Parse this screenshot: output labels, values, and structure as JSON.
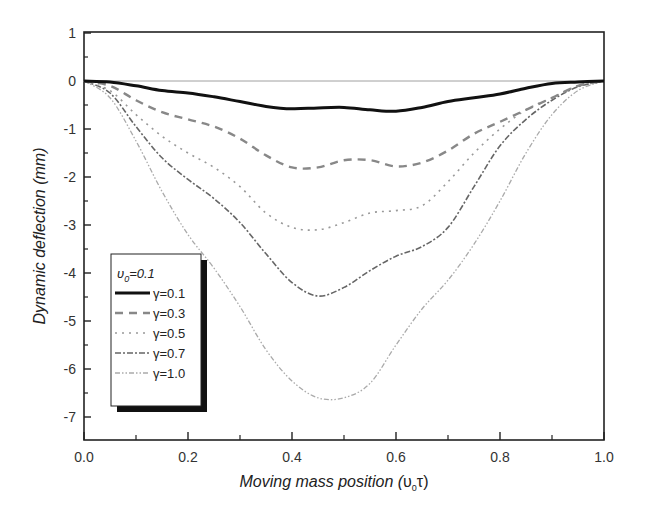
{
  "chart_data": {
    "type": "line",
    "title": "",
    "xlabel": "Moving mass position (υ0τ)",
    "xlabel_main": "Moving mass position (",
    "xlabel_sym": "υ",
    "xlabel_sub": "0",
    "xlabel_tau": "τ)",
    "ylabel": "Dynamic  deflection (mm)",
    "xlim": [
      0.0,
      1.0
    ],
    "ylim": [
      -7.5,
      1
    ],
    "xticks": [
      "0.0",
      "0.2",
      "0.4",
      "0.6",
      "0.8",
      "1.0"
    ],
    "yticks": [
      "1",
      "0",
      "-1",
      "-2",
      "-3",
      "-4",
      "-5",
      "-6",
      "-7"
    ],
    "grid": false,
    "legend_position": "lower-left inset",
    "legend_title": "υ0=0.1",
    "legend_title_sym": "υ",
    "legend_title_sub": "0",
    "legend_title_val": "=0.1",
    "x": [
      0.0,
      0.05,
      0.1,
      0.15,
      0.2,
      0.25,
      0.3,
      0.35,
      0.4,
      0.45,
      0.5,
      0.55,
      0.6,
      0.65,
      0.7,
      0.75,
      0.8,
      0.85,
      0.9,
      0.95,
      1.0
    ],
    "series": [
      {
        "name": "γ=0.1",
        "style": "solid-thick",
        "color": "#111111",
        "values": [
          0,
          -0.02,
          -0.1,
          -0.2,
          -0.25,
          -0.33,
          -0.43,
          -0.53,
          -0.58,
          -0.56,
          -0.55,
          -0.6,
          -0.63,
          -0.55,
          -0.43,
          -0.35,
          -0.27,
          -0.15,
          -0.05,
          -0.02,
          0
        ]
      },
      {
        "name": "γ=0.3",
        "style": "dashed",
        "color": "#888888",
        "values": [
          0,
          -0.1,
          -0.4,
          -0.65,
          -0.8,
          -0.95,
          -1.2,
          -1.55,
          -1.8,
          -1.8,
          -1.65,
          -1.65,
          -1.78,
          -1.7,
          -1.45,
          -1.1,
          -0.85,
          -0.6,
          -0.35,
          -0.1,
          0
        ]
      },
      {
        "name": "γ=0.5",
        "style": "dotted",
        "color": "#999999",
        "values": [
          0,
          -0.2,
          -0.7,
          -1.15,
          -1.5,
          -1.8,
          -2.2,
          -2.75,
          -3.05,
          -3.1,
          -2.95,
          -2.75,
          -2.7,
          -2.6,
          -2.1,
          -1.5,
          -1.0,
          -0.6,
          -0.35,
          -0.1,
          0
        ]
      },
      {
        "name": "γ=0.7",
        "style": "dash-dot",
        "color": "#666666",
        "values": [
          0,
          -0.25,
          -0.95,
          -1.6,
          -2.05,
          -2.45,
          -2.95,
          -3.6,
          -4.2,
          -4.48,
          -4.3,
          -3.95,
          -3.65,
          -3.45,
          -3.05,
          -2.2,
          -1.35,
          -0.8,
          -0.4,
          -0.12,
          0
        ]
      },
      {
        "name": "γ=1.0",
        "style": "dash-dot-dot",
        "color": "#aaaaaa",
        "values": [
          0,
          -0.35,
          -1.25,
          -2.3,
          -3.2,
          -3.9,
          -4.7,
          -5.6,
          -6.25,
          -6.6,
          -6.6,
          -6.3,
          -5.5,
          -4.75,
          -4.15,
          -3.4,
          -2.5,
          -1.5,
          -0.7,
          -0.2,
          0
        ]
      }
    ]
  }
}
